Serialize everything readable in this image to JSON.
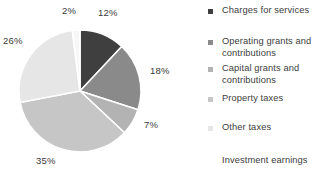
{
  "chart_data": {
    "type": "pie",
    "title": "",
    "categories": [
      "Charges for services",
      "Operating grants and contributions",
      "Capital grants and contributions",
      "Property taxes",
      "Other taxes",
      "Investment earnings"
    ],
    "values": [
      12,
      18,
      7,
      35,
      26,
      2
    ],
    "value_labels": [
      "12%",
      "18%",
      "7%",
      "35%",
      "26%",
      "2%"
    ],
    "units": "percent",
    "legend_position": "right",
    "grid": false,
    "colors": [
      "#3f3f3f",
      "#8a8a8a",
      "#b3b3b3",
      "#c6c6c6",
      "#e6e6e6",
      "#f7f7f7"
    ],
    "slice_border_color": "#ffffff",
    "start_angle_deg": 0,
    "direction": "clockwise",
    "label_color": "#3a3a3a"
  },
  "pie": {
    "center_x": 80,
    "center_y": 91,
    "radius": 61,
    "labels": [
      {
        "text": "12%",
        "x": 98,
        "y": 7
      },
      {
        "text": "18%",
        "x": 150,
        "y": 65
      },
      {
        "text": "7%",
        "x": 144,
        "y": 119
      },
      {
        "text": "35%",
        "x": 36,
        "y": 155
      },
      {
        "text": "26%",
        "x": 3,
        "y": 35
      },
      {
        "text": "2%",
        "x": 62,
        "y": 5
      }
    ]
  },
  "legend": {
    "items": [
      {
        "label": "Charges for services",
        "marker_color": "#3f3f3f",
        "has_marker": true,
        "top": 5,
        "name": "charges-for-services"
      },
      {
        "label": "Operating grants and\ncontributions",
        "marker_color": "#8a8a8a",
        "has_marker": true,
        "top": 36,
        "name": "operating-grants-and-contributions"
      },
      {
        "label": "Capital grants and\ncontributions",
        "marker_color": "#b3b3b3",
        "has_marker": true,
        "top": 63,
        "name": "capital-grants-and-contributions"
      },
      {
        "label": "Property taxes",
        "marker_color": "#c6c6c6",
        "has_marker": true,
        "top": 93,
        "name": "property-taxes"
      },
      {
        "label": "Other taxes",
        "marker_color": "#e6e6e6",
        "has_marker": true,
        "top": 122,
        "name": "other-taxes"
      },
      {
        "label": "Investment earnings",
        "marker_color": "#f7f7f7",
        "has_marker": false,
        "top": 155,
        "name": "investment-earnings"
      }
    ]
  }
}
